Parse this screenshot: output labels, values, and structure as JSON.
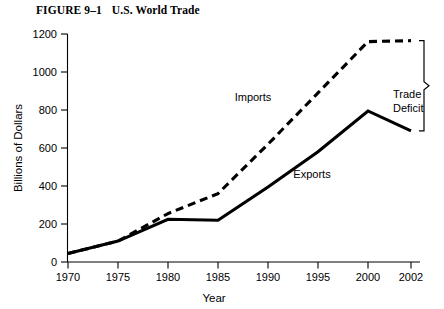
{
  "figure": {
    "number_label": "FIGURE 9–1",
    "title": "U.S. World Trade"
  },
  "chart_data": {
    "type": "line",
    "title": "U.S. World Trade",
    "xlabel": "Year",
    "ylabel": "Billions of Dollars",
    "x": [
      1970,
      1975,
      1980,
      1985,
      1990,
      1995,
      2000,
      2002
    ],
    "categories": [
      "1970",
      "1975",
      "1980",
      "1985",
      "1990",
      "1995",
      "2000",
      "2002"
    ],
    "xtick_labels": [
      "1970",
      "1975",
      "1980",
      "1985",
      "1990",
      "1995",
      "2000",
      "2002"
    ],
    "ytick_labels": [
      "0",
      "200",
      "400",
      "600",
      "800",
      "1000",
      "1200"
    ],
    "ytick_values": [
      0,
      200,
      400,
      600,
      800,
      1000,
      1200
    ],
    "ylim": [
      0,
      1200
    ],
    "grid": false,
    "legend_position": "inline-labels",
    "series": [
      {
        "name": "Imports",
        "style": "dashed",
        "color": "#000000",
        "values": [
          45,
          110,
          255,
          360,
          620,
          890,
          1160,
          1165
        ]
      },
      {
        "name": "Exports",
        "style": "solid",
        "color": "#000000",
        "values": [
          45,
          110,
          225,
          220,
          395,
          580,
          795,
          690
        ]
      }
    ],
    "annotations": [
      {
        "name": "trade-deficit",
        "text_line1": "Trade",
        "text_line2": "Deficit",
        "at_year": "2002",
        "spans_from": 690,
        "spans_to": 1165
      }
    ]
  },
  "labels": {
    "imports": "Imports",
    "exports": "Exports",
    "trade_deficit_line1": "Trade",
    "trade_deficit_line2": "Deficit",
    "x_axis": "Year",
    "y_axis": "Billions of Dollars"
  }
}
